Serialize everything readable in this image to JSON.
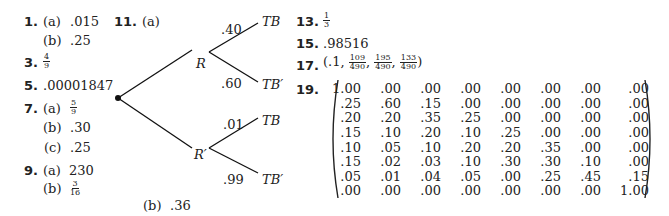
{
  "answers": {
    "a1": {
      "num": "1.",
      "a_label": "(a)",
      "a_val": ".015",
      "b_label": "(b)",
      "b_val": ".25"
    },
    "a3": {
      "num": "3.",
      "frac_n": "4",
      "frac_d": "9"
    },
    "a5": {
      "num": "5.",
      "val": ".00001847"
    },
    "a7": {
      "num": "7.",
      "a_label": "(a)",
      "a_frac_n": "5",
      "a_frac_d": "9",
      "b_label": "(b)",
      "b_val": ".30",
      "c_label": "(c)",
      "c_val": ".25"
    },
    "a9": {
      "num": "9.",
      "a_label": "(a)",
      "a_val": "230",
      "b_label": "(b)",
      "b_frac_n": "3",
      "b_frac_d": "16"
    },
    "a11": {
      "num": "11.",
      "a_label": "(a)",
      "b_label": "(b)",
      "b_val": ".36",
      "tree": {
        "node_R": "R",
        "node_Rp": "R′",
        "p_R_TB": ".40",
        "p_R_TBp": ".60",
        "p_Rp_TB": ".01",
        "p_Rp_TBp": ".99",
        "leaf_TB": "TB",
        "leaf_TBp": "TB′"
      }
    },
    "a13": {
      "num": "13.",
      "frac_n": "1",
      "frac_d": "3"
    },
    "a15": {
      "num": "15.",
      "val": ".98516"
    },
    "a17": {
      "num": "17.",
      "open": "(.1,",
      "f1_n": "109",
      "f1_d": "490",
      "f2_n": "195",
      "f2_d": "490",
      "f3_n": "133",
      "f3_d": "490",
      "close": ")"
    },
    "a19": {
      "num": "19.",
      "matrix": [
        [
          ".00",
          ".00",
          ".00",
          ".00",
          ".00",
          ".00",
          ".00",
          ".00"
        ],
        [
          ".25",
          ".60",
          ".15",
          ".00",
          ".00",
          ".00",
          ".00",
          ".00"
        ],
        [
          ".20",
          ".20",
          ".35",
          ".25",
          ".00",
          ".00",
          ".00",
          ".00"
        ],
        [
          ".15",
          ".10",
          ".20",
          ".10",
          ".25",
          ".00",
          ".00",
          ".00"
        ],
        [
          ".10",
          ".05",
          ".10",
          ".20",
          ".20",
          ".35",
          ".00",
          ".00"
        ],
        [
          ".15",
          ".02",
          ".03",
          ".10",
          ".30",
          ".30",
          ".10",
          ".00"
        ],
        [
          ".05",
          ".01",
          ".04",
          ".05",
          ".00",
          ".25",
          ".45",
          ".15"
        ],
        [
          ".00",
          ".00",
          ".00",
          ".00",
          ".00",
          ".00",
          ".00",
          "1.00"
        ]
      ],
      "first_cell": "1.00"
    }
  }
}
